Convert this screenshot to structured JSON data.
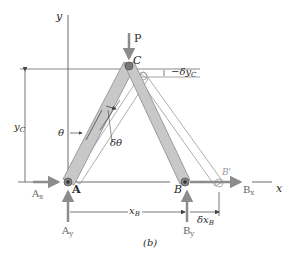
{
  "figure": {
    "caption": "(b)",
    "colors": {
      "member_fill": "#c8c8c8",
      "member_stroke": "#8a8a8a",
      "force_arrow": "#8c8c8c",
      "displaced_outline": "#9a9a9a",
      "axis_line": "#6a6a6a",
      "dimension_line": "#555555",
      "text": "#2a2a2a"
    }
  },
  "labels": {
    "y_axis": "y",
    "x_axis": "x",
    "load": "P",
    "joint_c": "C",
    "joint_a": "A",
    "joint_b": "B",
    "joint_b_displaced": "B'",
    "delta_yc": "−δy",
    "delta_yc_sub": "C",
    "y_c": "y",
    "y_c_sub": "C",
    "theta": "θ",
    "delta_theta": "δθ",
    "a_x": "A",
    "a_x_sub": "x",
    "a_y": "A",
    "a_y_sub": "y",
    "b_x": "B",
    "b_x_sub": "x",
    "b_y": "B",
    "b_y_sub": "y",
    "x_b": "x",
    "x_b_sub": "B",
    "delta_x_b": "δx",
    "delta_x_b_sub": "B"
  }
}
